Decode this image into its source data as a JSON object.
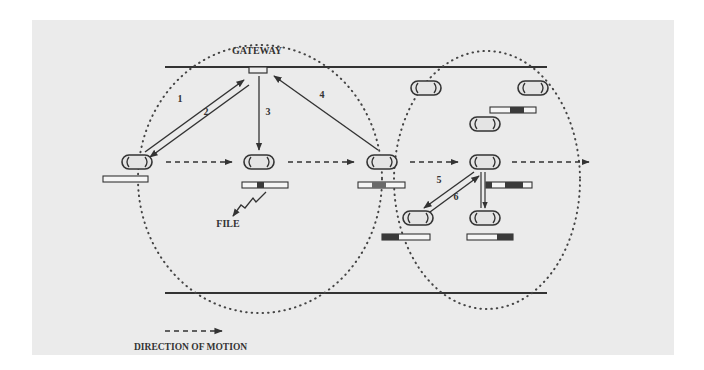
{
  "diagram": {
    "title_label": "GATEWAY",
    "file_label": "FILE",
    "legend_label": "DIRECTION OF MOTION",
    "step_labels": [
      "1",
      "2",
      "3",
      "4",
      "5",
      "6"
    ],
    "colors": {
      "background": "#ebebeb",
      "ink": "#333333",
      "bar_fill": "#f5f5f5",
      "bar_dark": "#3a3a3a"
    },
    "vehicles": [
      {
        "id": "v1",
        "x": 137,
        "y": 162,
        "bar": "empty"
      },
      {
        "id": "v2",
        "x": 259,
        "y": 162,
        "bar": "partial-center"
      },
      {
        "id": "v3",
        "x": 382,
        "y": 162,
        "bar": "partial-center-more"
      },
      {
        "id": "v4",
        "x": 485,
        "y": 162,
        "bar": "partial-split"
      },
      {
        "id": "v5",
        "x": 426,
        "y": 88,
        "bar": "none"
      },
      {
        "id": "v6",
        "x": 533,
        "y": 88,
        "bar": "partial-center"
      },
      {
        "id": "v7",
        "x": 485,
        "y": 124,
        "bar": "none"
      },
      {
        "id": "v8",
        "x": 418,
        "y": 218,
        "bar": "left-dark"
      },
      {
        "id": "v9",
        "x": 485,
        "y": 218,
        "bar": "right-dark"
      }
    ]
  }
}
